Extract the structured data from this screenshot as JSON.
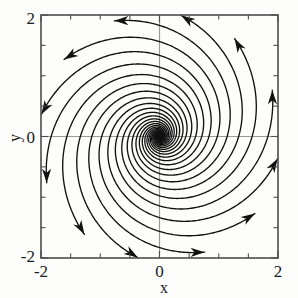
{
  "figure": {
    "background_color": "#fdfdfc",
    "frame_color": "#555555",
    "curve_color": "#111111",
    "axis_line_color": "#9a9a9a"
  },
  "chart_data": {
    "type": "line",
    "title": "",
    "subtitle": "",
    "xlabel": "x",
    "ylabel": "y",
    "xlim": [
      -2,
      2
    ],
    "ylim": [
      -2,
      2
    ],
    "grid": false,
    "legend": "none",
    "xticks": [
      -2,
      0,
      2
    ],
    "xtick_labels": [
      "-2",
      "0",
      "2"
    ],
    "yticks": [
      -2,
      0,
      2
    ],
    "ytick_labels": [
      "-2",
      "0",
      "2"
    ],
    "minor_ticks_per_axis": 8,
    "axis_lines": [
      {
        "name": "x-axis-zero-line",
        "value": 0,
        "orientation": "horizontal"
      },
      {
        "name": "y-axis-zero-line",
        "value": 0,
        "orientation": "vertical"
      }
    ],
    "fixed_point": {
      "x": 0,
      "y": 0,
      "classification": "unstable spiral"
    },
    "spiral": {
      "direction": "counterclockwise",
      "flow": "outward",
      "n_trajectories": 12,
      "growth_rate_a": 0.3,
      "angular_rate_b": 1.0,
      "r_start": 0.012,
      "r_end": 2.05,
      "start_angles_deg": [
        0,
        30,
        60,
        90,
        120,
        150,
        180,
        210,
        240,
        270,
        300,
        330
      ]
    },
    "series": [
      {
        "name": "trajectory-1",
        "start_angle_deg": 0
      },
      {
        "name": "trajectory-2",
        "start_angle_deg": 30
      },
      {
        "name": "trajectory-3",
        "start_angle_deg": 60
      },
      {
        "name": "trajectory-4",
        "start_angle_deg": 90
      },
      {
        "name": "trajectory-5",
        "start_angle_deg": 120
      },
      {
        "name": "trajectory-6",
        "start_angle_deg": 150
      },
      {
        "name": "trajectory-7",
        "start_angle_deg": 180
      },
      {
        "name": "trajectory-8",
        "start_angle_deg": 210
      },
      {
        "name": "trajectory-9",
        "start_angle_deg": 240
      },
      {
        "name": "trajectory-10",
        "start_angle_deg": 270
      },
      {
        "name": "trajectory-11",
        "start_angle_deg": 300
      },
      {
        "name": "trajectory-12",
        "start_angle_deg": 330
      }
    ]
  },
  "labels": {
    "x_axis_title": "x",
    "y_axis_title": "y",
    "x_min": "-2",
    "x_mid": "0",
    "x_max": "2",
    "y_min": "-2",
    "y_mid": "0",
    "y_max": "2"
  }
}
